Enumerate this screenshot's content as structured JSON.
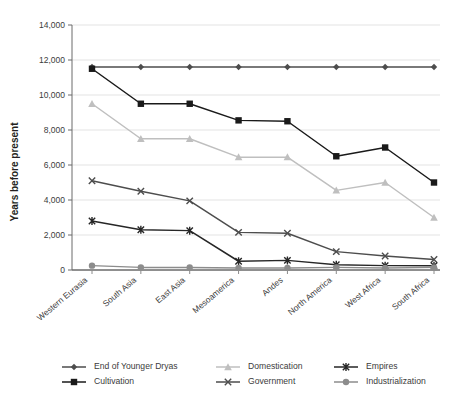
{
  "chart_data": {
    "type": "line",
    "title": "",
    "xlabel": "",
    "ylabel": "Years before present",
    "ylim": [
      0,
      14000
    ],
    "ystep": 2000,
    "grid": true,
    "legend_position": "bottom",
    "categories": [
      "Western Eurasia",
      "South Asia",
      "East Asia",
      "Mesoamerica",
      "Andes",
      "North America",
      "West Africa",
      "South Africa"
    ],
    "ytick_labels": [
      "0",
      "2,000",
      "4,000",
      "6,000",
      "8,000",
      "10,000",
      "12,000",
      "14,000"
    ],
    "ytick_values": [
      0,
      2000,
      4000,
      6000,
      8000,
      10000,
      12000,
      14000
    ],
    "series": [
      {
        "name": "End of Younger Dryas",
        "marker": "diamond",
        "color": "#4d4d4d",
        "values": [
          11600,
          11600,
          11600,
          11600,
          11600,
          11600,
          11600,
          11600
        ]
      },
      {
        "name": "Cultivation",
        "marker": "square",
        "color": "#1a1a1a",
        "values": [
          11500,
          9500,
          9500,
          8550,
          8500,
          6500,
          7000,
          5000
        ]
      },
      {
        "name": "Domestication",
        "marker": "triangle",
        "color": "#bfbfbf",
        "values": [
          9500,
          7500,
          7500,
          6450,
          6450,
          4550,
          5000,
          3000
        ]
      },
      {
        "name": "Government",
        "marker": "cross",
        "color": "#4d4d4d",
        "values": [
          5100,
          4500,
          3950,
          2150,
          2100,
          1050,
          800,
          600
        ]
      },
      {
        "name": "Empires",
        "marker": "asterisk",
        "color": "#262626",
        "values": [
          2800,
          2300,
          2250,
          500,
          550,
          300,
          250,
          250
        ]
      },
      {
        "name": "Industrialization",
        "marker": "circle",
        "color": "#8c8c8c",
        "values": [
          250,
          150,
          150,
          120,
          120,
          150,
          120,
          150
        ]
      }
    ]
  },
  "legend": {
    "items": [
      {
        "label": "End of Younger Dryas"
      },
      {
        "label": "Cultivation"
      },
      {
        "label": "Domestication"
      },
      {
        "label": "Government"
      },
      {
        "label": "Empires"
      },
      {
        "label": "Industrialization"
      }
    ]
  }
}
